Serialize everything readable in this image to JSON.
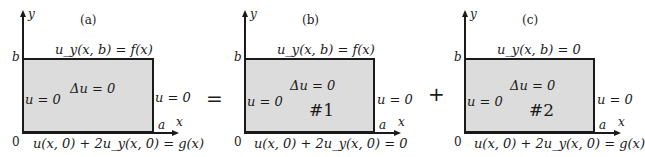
{
  "figure": {
    "operators": {
      "equals": "=",
      "plus": "+"
    },
    "panels": [
      {
        "id": "a",
        "label": "(a)",
        "axis_y": "y",
        "axis_x": "x",
        "origin": "0",
        "corner_b": "b",
        "corner_a": "a",
        "top_bc": "u_y(x, b) = f(x)",
        "left_bc": "u = 0",
        "right_bc": "u = 0",
        "bottom_bc": "u(x, 0) + 2u_y(x, 0) = g(x)",
        "equation": "Δu = 0",
        "problem_number": ""
      },
      {
        "id": "b",
        "label": "(b)",
        "axis_y": "y",
        "axis_x": "x",
        "origin": "0",
        "corner_b": "b",
        "corner_a": "a",
        "top_bc": "u_y(x, b) = f(x)",
        "left_bc": "u = 0",
        "right_bc": "u = 0",
        "bottom_bc": "u(x, 0) + 2u_y(x, 0) = 0",
        "equation": "Δu = 0",
        "problem_number": "#1"
      },
      {
        "id": "c",
        "label": "(c)",
        "axis_y": "y",
        "axis_x": "x",
        "origin": "0",
        "corner_b": "b",
        "corner_a": "a",
        "top_bc": "u_y(x, b) = 0",
        "left_bc": "u = 0",
        "right_bc": "u = 0",
        "bottom_bc": "u(x, 0) + 2u_y(x, 0) = g(x)",
        "equation": "Δu = 0",
        "problem_number": "#2"
      }
    ],
    "colors": {
      "fill": "#dcdcdc",
      "stroke": "#1a1a1a",
      "background": "#ffffff"
    }
  }
}
